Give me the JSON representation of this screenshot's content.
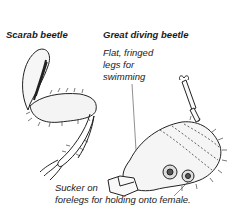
{
  "titles": {
    "left": "Scarab beetle",
    "right": "Great diving beetle"
  },
  "labels": {
    "swimming": [
      "Flat, fringed",
      "legs for",
      "swimming"
    ],
    "sucker": [
      "Sucker on",
      "forelegs for holding onto female."
    ]
  }
}
